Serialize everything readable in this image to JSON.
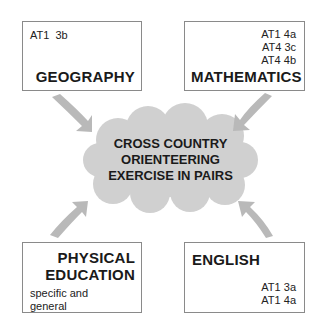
{
  "center": {
    "lines": [
      "CROSS COUNTRY",
      "ORIENTEERING",
      "EXERCISE IN PAIRS"
    ]
  },
  "boxes": {
    "geography": {
      "title": "GEOGRAPHY",
      "codes": [
        "AT1  3b"
      ]
    },
    "mathematics": {
      "title": "MATHEMATICS",
      "codes": [
        "AT1 4a",
        "AT4 3c",
        "AT4 4b"
      ]
    },
    "physical_education": {
      "title_lines": [
        "PHYSICAL",
        "EDUCATION"
      ],
      "notes": [
        "specific and",
        "general"
      ]
    },
    "english": {
      "title": "ENGLISH",
      "codes": [
        "AT1 3a",
        "AT1 4a"
      ]
    }
  },
  "colors": {
    "cloud": "#d0d0d0",
    "arrow": "#b9b9b9",
    "border": "#8a8a8a"
  }
}
